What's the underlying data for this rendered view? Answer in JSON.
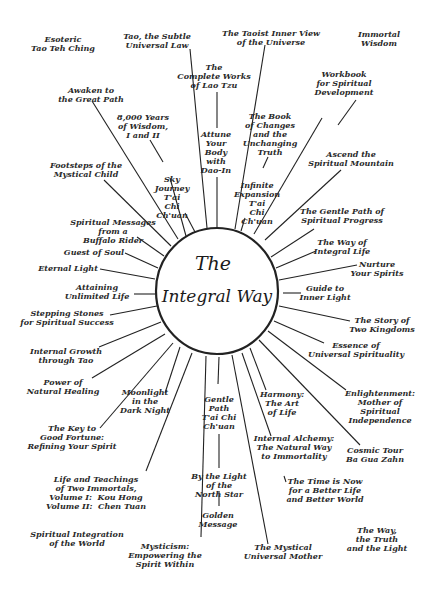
{
  "diagram": {
    "hub": {
      "title_line1": "The",
      "title_line2": "Integral Way",
      "cx": 217,
      "cy": 291,
      "r": 63
    },
    "line_color": "#222222",
    "background": "#ffffff",
    "spokes": [
      {
        "id": "tao-subtle",
        "x1": 190,
        "y1": 49,
        "x2": 207,
        "y2": 228
      },
      {
        "id": "taoist-inner-view",
        "x1": 265,
        "y1": 45,
        "x2": 235,
        "y2": 229
      },
      {
        "id": "attune-body",
        "x1": 217,
        "y1": 92,
        "x2": 217,
        "y2": 128
      },
      {
        "id": "attune-body-2",
        "x1": 217,
        "y1": 177,
        "x2": 217,
        "y2": 228
      },
      {
        "id": "awaken",
        "x1": 92,
        "y1": 101,
        "x2": 178,
        "y2": 239
      },
      {
        "id": "8000-years",
        "x1": 150,
        "y1": 140,
        "x2": 163,
        "y2": 162
      },
      {
        "id": "sky-journey",
        "x1": 185,
        "y1": 213,
        "x2": 195,
        "y2": 232
      },
      {
        "id": "sky-journey-2",
        "x1": 170,
        "y1": 178,
        "x2": 186,
        "y2": 236
      },
      {
        "id": "book-changes",
        "x1": 268,
        "y1": 157,
        "x2": 263,
        "y2": 168
      },
      {
        "id": "infinite-exp",
        "x1": 245,
        "y1": 218,
        "x2": 241,
        "y2": 231
      },
      {
        "id": "book-changes-line",
        "x1": 322,
        "y1": 118,
        "x2": 254,
        "y2": 234
      },
      {
        "id": "ascend-mountain",
        "x1": 341,
        "y1": 170,
        "x2": 265,
        "y2": 240
      },
      {
        "id": "gentle-path-progress",
        "x1": 314,
        "y1": 229,
        "x2": 271,
        "y2": 257
      },
      {
        "id": "way-integral",
        "x1": 316,
        "y1": 251,
        "x2": 276,
        "y2": 268
      },
      {
        "id": "nurture",
        "x1": 357,
        "y1": 265,
        "x2": 279,
        "y2": 280
      },
      {
        "id": "guide-inner",
        "x1": 301,
        "y1": 293,
        "x2": 283,
        "y2": 293
      },
      {
        "id": "story-kingdoms",
        "x1": 350,
        "y1": 321,
        "x2": 279,
        "y2": 306
      },
      {
        "id": "essence",
        "x1": 324,
        "y1": 343,
        "x2": 274,
        "y2": 321
      },
      {
        "id": "enlightenment",
        "x1": 346,
        "y1": 390,
        "x2": 268,
        "y2": 331
      },
      {
        "id": "cosmic-tour",
        "x1": 360,
        "y1": 445,
        "x2": 259,
        "y2": 340
      },
      {
        "id": "harmony",
        "x1": 266,
        "y1": 390,
        "x2": 250,
        "y2": 348
      },
      {
        "id": "internal-alchemy",
        "x1": 271,
        "y1": 436,
        "x2": 242,
        "y2": 353
      },
      {
        "id": "time-is-now",
        "x1": 284,
        "y1": 476,
        "x2": 286,
        "y2": 482
      },
      {
        "id": "mystical-mother",
        "x1": 268,
        "y1": 544,
        "x2": 232,
        "y2": 355
      },
      {
        "id": "gentle-path-tai-chi",
        "x1": 219,
        "y1": 357,
        "x2": 218,
        "y2": 384
      },
      {
        "id": "by-light",
        "x1": 219,
        "y1": 434,
        "x2": 219,
        "y2": 468
      },
      {
        "id": "golden",
        "x1": 219,
        "y1": 491,
        "x2": 219,
        "y2": 506
      },
      {
        "id": "mysticism",
        "x1": 201,
        "y1": 537,
        "x2": 206,
        "y2": 356
      },
      {
        "id": "life-teachings",
        "x1": 146,
        "y1": 471,
        "x2": 192,
        "y2": 353
      },
      {
        "id": "moonlight",
        "x1": 165,
        "y1": 393,
        "x2": 180,
        "y2": 347
      },
      {
        "id": "key-fortune",
        "x1": 100,
        "y1": 428,
        "x2": 173,
        "y2": 343
      },
      {
        "id": "natural-healing",
        "x1": 92,
        "y1": 378,
        "x2": 165,
        "y2": 334
      },
      {
        "id": "internal-growth",
        "x1": 99,
        "y1": 347,
        "x2": 161,
        "y2": 322
      },
      {
        "id": "stepping-stones",
        "x1": 110,
        "y1": 315,
        "x2": 157,
        "y2": 306
      },
      {
        "id": "unlimited-life",
        "x1": 134,
        "y1": 294,
        "x2": 155,
        "y2": 294
      },
      {
        "id": "eternal-light",
        "x1": 100,
        "y1": 269,
        "x2": 155,
        "y2": 279
      },
      {
        "id": "quest-soul",
        "x1": 125,
        "y1": 253,
        "x2": 158,
        "y2": 268
      },
      {
        "id": "buffalo-rider",
        "x1": 137,
        "y1": 237,
        "x2": 164,
        "y2": 256
      },
      {
        "id": "footsteps",
        "x1": 104,
        "y1": 180,
        "x2": 171,
        "y2": 246
      },
      {
        "id": "workbook",
        "x1": 356,
        "y1": 100,
        "x2": 338,
        "y2": 125
      }
    ],
    "labels": [
      {
        "id": "esoteric",
        "text": "Esoteric\nTao Teh Ching",
        "x": 63,
        "y": 35,
        "align": "c"
      },
      {
        "id": "tao-subtle",
        "text": "Tao, the Subtle\nUniversal Law",
        "x": 157,
        "y": 32,
        "align": "c"
      },
      {
        "id": "taoist-inner-view",
        "text": "The Taoist Inner View\nof the Universe",
        "x": 271,
        "y": 29,
        "align": "c"
      },
      {
        "id": "immortal-wisdom",
        "text": "Immortal\nWisdom",
        "x": 379,
        "y": 30,
        "align": "c"
      },
      {
        "id": "complete-works",
        "text": "The\nComplete Works\nof Lao Tzu",
        "x": 214,
        "y": 63,
        "align": "c"
      },
      {
        "id": "workbook",
        "text": "Workbook\nfor Spiritual\nDevelopment",
        "x": 344,
        "y": 70,
        "align": "c"
      },
      {
        "id": "awaken",
        "text": "Awaken to\nthe Great Path",
        "x": 91,
        "y": 86,
        "align": "c"
      },
      {
        "id": "8000-years",
        "text": "8,000 Years\nof Wisdom,\nI and II",
        "x": 143,
        "y": 113,
        "align": "c"
      },
      {
        "id": "book-changes",
        "text": "The Book\nof Changes\nand the\nUnchanging\nTruth",
        "x": 270,
        "y": 112,
        "align": "c"
      },
      {
        "id": "attune",
        "text": "Attune\nYour\nBody\nwith\nDao-In",
        "x": 216,
        "y": 130,
        "align": "c"
      },
      {
        "id": "ascend",
        "text": "Ascend the\nSpiritual Mountain",
        "x": 351,
        "y": 150,
        "align": "c"
      },
      {
        "id": "footsteps",
        "text": "Footsteps of the\nMystical Child",
        "x": 86,
        "y": 161,
        "align": "c"
      },
      {
        "id": "sky-journey",
        "text": "Sky\nJourney\nT'ai\nChi\nCh'uan",
        "x": 172,
        "y": 175,
        "align": "c"
      },
      {
        "id": "infinite-expansion",
        "text": "Infinite\nExpansion\nT'ai\nChi\nCh'uan",
        "x": 257,
        "y": 181,
        "align": "c"
      },
      {
        "id": "gentle-path-progress",
        "text": "The Gentle Path of\nSpiritual Progress",
        "x": 342,
        "y": 207,
        "align": "c"
      },
      {
        "id": "buffalo-rider",
        "text": "Spiritual Messages\nfrom a\nBuffalo Rider",
        "x": 113,
        "y": 218,
        "align": "c"
      },
      {
        "id": "way-integral",
        "text": "The Way of\nIntegral Life",
        "x": 342,
        "y": 238,
        "align": "c"
      },
      {
        "id": "quest-soul",
        "text": "Guest of Soul",
        "x": 94,
        "y": 248,
        "align": "c"
      },
      {
        "id": "nurture",
        "text": "Nurture\nYour Spirits",
        "x": 377,
        "y": 260,
        "align": "c"
      },
      {
        "id": "eternal-light",
        "text": "Eternal Light",
        "x": 68,
        "y": 264,
        "align": "c"
      },
      {
        "id": "unlimited-life",
        "text": "Attaining\nUnlimited Life",
        "x": 97,
        "y": 283,
        "align": "c"
      },
      {
        "id": "guide-inner",
        "text": "Guide to\nInner Light",
        "x": 325,
        "y": 284,
        "align": "c"
      },
      {
        "id": "stepping-stones",
        "text": "Stepping Stones\nfor Spiritual Success",
        "x": 67,
        "y": 309,
        "align": "c"
      },
      {
        "id": "story-kingdoms",
        "text": "The Story of\nTwo Kingdoms",
        "x": 382,
        "y": 316,
        "align": "c"
      },
      {
        "id": "essence",
        "text": "Essence of\nUniversal Spirituality",
        "x": 356,
        "y": 341,
        "align": "c"
      },
      {
        "id": "internal-growth",
        "text": "Internal Growth\nthrough Tao",
        "x": 66,
        "y": 347,
        "align": "c"
      },
      {
        "id": "natural-healing",
        "text": "Power of\nNatural Healing",
        "x": 63,
        "y": 378,
        "align": "c"
      },
      {
        "id": "moonlight",
        "text": "Moonlight\nin the\nDark Night",
        "x": 145,
        "y": 388,
        "align": "c"
      },
      {
        "id": "gentle-path-tai-chi",
        "text": "Gentle\nPath\nT'ai Chi\nCh'uan",
        "x": 219,
        "y": 395,
        "align": "c"
      },
      {
        "id": "harmony",
        "text": "Harmony:\nThe Art\nof Life",
        "x": 282,
        "y": 390,
        "align": "c"
      },
      {
        "id": "enlightenment",
        "text": "Enlightenment:\nMother of\nSpiritual\nIndependence",
        "x": 380,
        "y": 389,
        "align": "c"
      },
      {
        "id": "key-fortune",
        "text": "The Key to\nGood Fortune:\nRefining Your Spirit",
        "x": 72,
        "y": 424,
        "align": "c"
      },
      {
        "id": "internal-alchemy",
        "text": "Internal Alchemy:\nThe Natural Way\nto Immortality",
        "x": 294,
        "y": 434,
        "align": "c"
      },
      {
        "id": "cosmic-tour",
        "text": "Cosmic Tour\nBa Gua Zahn",
        "x": 375,
        "y": 446,
        "align": "c"
      },
      {
        "id": "by-light",
        "text": "By the Light\nof the\nNorth Star",
        "x": 219,
        "y": 472,
        "align": "c"
      },
      {
        "id": "life-teachings",
        "text": "Life and Teachings\nof Two Immortals,\nVolume I:  Kou Hong\nVolume II:  Chen Tuan",
        "x": 96,
        "y": 475,
        "align": "c"
      },
      {
        "id": "time-is-now",
        "text": "The Time is Now\nfor a Better Life\nand Better World",
        "x": 325,
        "y": 477,
        "align": "c"
      },
      {
        "id": "golden-message",
        "text": "Golden\nMessage",
        "x": 218,
        "y": 511,
        "align": "c"
      },
      {
        "id": "the-way-truth",
        "text": "The Way,\nthe Truth\nand the Light",
        "x": 377,
        "y": 526,
        "align": "c"
      },
      {
        "id": "spiritual-integration",
        "text": "Spiritual Integration\nof the World",
        "x": 77,
        "y": 530,
        "align": "c"
      },
      {
        "id": "mystical-mother",
        "text": "The Mystical\nUniversal Mother",
        "x": 283,
        "y": 543,
        "align": "c"
      },
      {
        "id": "mysticism",
        "text": "Mysticism:\nEmpowering the\nSpirit Within",
        "x": 165,
        "y": 542,
        "align": "c"
      }
    ]
  }
}
